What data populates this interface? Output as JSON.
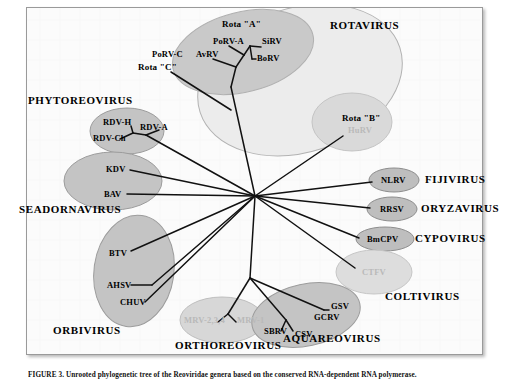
{
  "figure": {
    "type": "phylogenetic-tree",
    "caption": "FIGURE 3. Unrooted phylogenetic tree of the Reoviridae genera based on the conserved RNA-dependent RNA polymerase."
  },
  "genera": [
    {
      "name": "ROTAVIRUS",
      "x": 330,
      "y": 25,
      "id": "rotavirus"
    },
    {
      "name": "PHYTOREOVIRUS",
      "x": 28,
      "y": 100,
      "id": "phytoreovirus"
    },
    {
      "name": "SEADORNAVIRUS",
      "x": 20,
      "y": 209,
      "id": "seadornavirus"
    },
    {
      "name": "FIJIVIRUS",
      "x": 418,
      "y": 179,
      "id": "fijivirus"
    },
    {
      "name": "ORYZAVIRUS",
      "x": 412,
      "y": 207,
      "id": "oryzavirus"
    },
    {
      "name": "CYPOVIRUS",
      "x": 410,
      "y": 238,
      "id": "cypovirus"
    },
    {
      "name": "COLTIVIRUS",
      "x": 385,
      "y": 296,
      "id": "coltivirus"
    },
    {
      "name": "ORBIVIRUS",
      "x": 53,
      "y": 330,
      "id": "orbivirus"
    },
    {
      "name": "ORTHOREOVIRUS",
      "x": 176,
      "y": 344,
      "id": "orthoreovirus"
    },
    {
      "name": "AQUAREOVIRUS",
      "x": 285,
      "y": 337,
      "id": "aquareovirus"
    }
  ],
  "taxa": [
    {
      "label": "Rota \"A\"",
      "x": 222,
      "y": 24,
      "style": "bold",
      "faded": false,
      "id": "rota-a"
    },
    {
      "label": "PoRV-A",
      "x": 213,
      "y": 41,
      "style": "plain",
      "faded": false,
      "id": "porv-a"
    },
    {
      "label": "SiRV",
      "x": 262,
      "y": 41,
      "style": "plain",
      "faded": false,
      "id": "sirv"
    },
    {
      "label": "AvRV",
      "x": 198,
      "y": 54,
      "style": "plain",
      "faded": false,
      "id": "avrv"
    },
    {
      "label": "BoRV",
      "x": 255,
      "y": 57,
      "style": "plain",
      "faded": false,
      "id": "borv"
    },
    {
      "label": "PoRV-C",
      "x": 153,
      "y": 54,
      "style": "plain",
      "faded": false,
      "id": "porv-c"
    },
    {
      "label": "Rota \"C\"",
      "x": 140,
      "y": 67,
      "style": "bold",
      "faded": false,
      "id": "rota-c"
    },
    {
      "label": "Rota \"B\"",
      "x": 343,
      "y": 118,
      "style": "bold",
      "faded": false,
      "id": "rota-b"
    },
    {
      "label": "HuRV",
      "x": 348,
      "y": 130,
      "style": "plain",
      "faded": true,
      "id": "hurv"
    },
    {
      "label": "RDV-H",
      "x": 104,
      "y": 122,
      "style": "plain",
      "faded": false,
      "id": "rdv-h"
    },
    {
      "label": "RDV-A",
      "x": 141,
      "y": 127,
      "style": "plain",
      "faded": false,
      "id": "rdv-a"
    },
    {
      "label": "RDV-Ch",
      "x": 95,
      "y": 138,
      "style": "plain",
      "faded": false,
      "id": "rdv-ch"
    },
    {
      "label": "KDV",
      "x": 106,
      "y": 169,
      "style": "plain",
      "faded": false,
      "id": "kdv"
    },
    {
      "label": "BAV",
      "x": 104,
      "y": 194,
      "style": "plain",
      "faded": false,
      "id": "bav"
    },
    {
      "label": "NLRV",
      "x": 381,
      "y": 180,
      "style": "plain",
      "faded": false,
      "id": "nlrv"
    },
    {
      "label": "RRSV",
      "x": 379,
      "y": 209,
      "style": "plain",
      "faded": false,
      "id": "rrsv"
    },
    {
      "label": "BmCPV",
      "x": 368,
      "y": 239,
      "style": "plain",
      "faded": false,
      "id": "bmcpv"
    },
    {
      "label": "CTFV",
      "x": 363,
      "y": 272,
      "style": "plain",
      "faded": true,
      "id": "ctfv"
    },
    {
      "label": "BTV",
      "x": 109,
      "y": 253,
      "style": "plain",
      "faded": false,
      "id": "btv"
    },
    {
      "label": "AHSV",
      "x": 110,
      "y": 287,
      "style": "plain",
      "faded": false,
      "id": "ahsv"
    },
    {
      "label": "CHUV",
      "x": 122,
      "y": 304,
      "style": "plain",
      "faded": false,
      "id": "chuv"
    },
    {
      "label": "MRV-2,3,4",
      "x": 186,
      "y": 320,
      "style": "plain",
      "faded": true,
      "id": "mrv-234"
    },
    {
      "label": "MRV-1",
      "x": 238,
      "y": 320,
      "style": "plain",
      "faded": true,
      "id": "mrv-1"
    },
    {
      "label": "SBRV",
      "x": 265,
      "y": 330,
      "style": "plain",
      "faded": false,
      "id": "sbrv"
    },
    {
      "label": "CSV",
      "x": 296,
      "y": 333,
      "style": "plain",
      "faded": false,
      "id": "csv"
    },
    {
      "label": "GSV",
      "x": 330,
      "y": 306,
      "style": "plain",
      "faded": false,
      "id": "gsv"
    },
    {
      "label": "GCRV",
      "x": 316,
      "y": 317,
      "style": "plain",
      "faded": false,
      "id": "gcrv"
    }
  ],
  "clusters": [
    {
      "id": "rotavirus-outer",
      "cx": 300,
      "cy": 80,
      "rx": 105,
      "ry": 72,
      "rot": -18,
      "fill": "#ececec",
      "stroke": "#b0b0b0"
    },
    {
      "id": "rotavirus-a-inner",
      "cx": 243,
      "cy": 52,
      "rx": 72,
      "ry": 40,
      "rot": -14,
      "fill": "#c9c9c9",
      "stroke": "#b0b0b0"
    },
    {
      "id": "rotavirus-b-inner",
      "cx": 352,
      "cy": 122,
      "rx": 40,
      "ry": 29,
      "rot": 0,
      "fill": "#d8d8d8",
      "stroke": "#c2c2c2"
    },
    {
      "id": "phytoreovirus-oval",
      "cx": 127,
      "cy": 131,
      "rx": 37,
      "ry": 23,
      "rot": 0,
      "fill": "#c3c3c3",
      "stroke": "#9b9b9b"
    },
    {
      "id": "seadornavirus-oval",
      "cx": 113,
      "cy": 181,
      "rx": 49,
      "ry": 29,
      "rot": 0,
      "fill": "#c3c3c3",
      "stroke": "#9b9b9b"
    },
    {
      "id": "fijivirus-oval",
      "cx": 394,
      "cy": 180,
      "rx": 25,
      "ry": 12,
      "rot": 0,
      "fill": "#bdbdbd",
      "stroke": "#8c8c8c"
    },
    {
      "id": "oryzavirus-oval",
      "cx": 392,
      "cy": 209,
      "rx": 25,
      "ry": 12,
      "rot": 0,
      "fill": "#bdbdbd",
      "stroke": "#8c8c8c"
    },
    {
      "id": "cypovirus-oval",
      "cx": 385,
      "cy": 239,
      "rx": 29,
      "ry": 12,
      "rot": 0,
      "fill": "#bdbdbd",
      "stroke": "#8c8c8c"
    },
    {
      "id": "coltivirus-oval",
      "cx": 374,
      "cy": 272,
      "rx": 38,
      "ry": 22,
      "rot": 0,
      "fill": "#dcdcdc",
      "stroke": "#c4c4c4"
    },
    {
      "id": "orbivirus-oval",
      "cx": 134,
      "cy": 271,
      "rx": 40,
      "ry": 56,
      "rot": 8,
      "fill": "#c3c3c3",
      "stroke": "#9b9b9b"
    },
    {
      "id": "orthoreovirus-oval",
      "cx": 222,
      "cy": 320,
      "rx": 42,
      "ry": 23,
      "rot": 0,
      "fill": "#d6d6d6",
      "stroke": "#bdbdbd"
    },
    {
      "id": "aquareovirus-oval",
      "cx": 306,
      "cy": 315,
      "rx": 55,
      "ry": 31,
      "rot": -12,
      "fill": "#c3c3c3",
      "stroke": "#9b9b9b"
    }
  ],
  "tree": {
    "center": {
      "x": 255,
      "y": 196
    },
    "description": "Unrooted star topology radiating from a central node to each genus clade."
  }
}
